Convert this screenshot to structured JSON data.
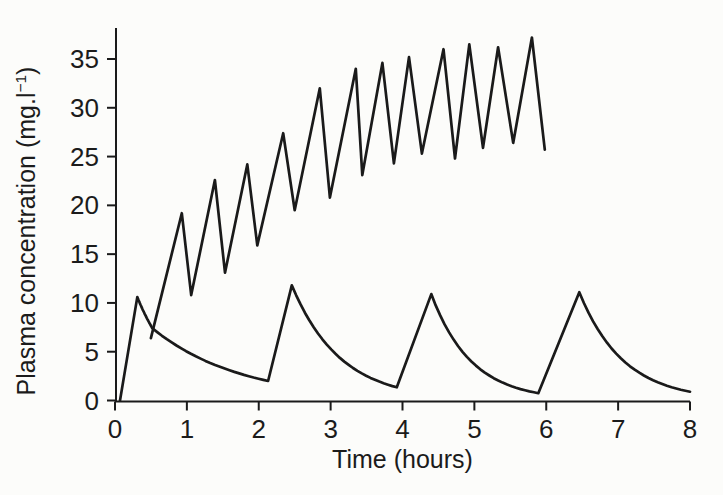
{
  "figure": {
    "background_color": "#fcfcfa",
    "ink_color": "#1a1a1a"
  },
  "chart_data": {
    "type": "line",
    "title": "",
    "xlabel": "Time (hours)",
    "ylabel": "Plasma concentration (mg.l⁻¹)",
    "ylabel_parts": {
      "pre": "Plasma concentration (mg.l",
      "sup": "−1",
      "post": ")"
    },
    "xlim": [
      0,
      8
    ],
    "ylim": [
      0,
      38
    ],
    "xticks": [
      0,
      1,
      2,
      3,
      4,
      5,
      6,
      7,
      8
    ],
    "yticks": [
      0,
      5,
      10,
      15,
      20,
      25,
      30,
      35
    ],
    "grid": false,
    "legend_position": "none",
    "series": [
      {
        "name": "frequent-repeated-doses-sawtooth",
        "interp": "linear",
        "points": [
          [
            0.5,
            6.4
          ],
          [
            0.93,
            19.2
          ],
          [
            1.06,
            10.8
          ],
          [
            1.39,
            22.6
          ],
          [
            1.53,
            13.1
          ],
          [
            1.84,
            24.2
          ],
          [
            1.98,
            15.9
          ],
          [
            2.34,
            27.4
          ],
          [
            2.5,
            19.5
          ],
          [
            2.85,
            32.0
          ],
          [
            2.99,
            20.8
          ],
          [
            3.35,
            34.0
          ],
          [
            3.44,
            23.1
          ],
          [
            3.72,
            34.6
          ],
          [
            3.88,
            24.3
          ],
          [
            4.09,
            35.2
          ],
          [
            4.27,
            25.3
          ],
          [
            4.57,
            36.0
          ],
          [
            4.73,
            24.8
          ],
          [
            4.93,
            36.5
          ],
          [
            5.12,
            25.9
          ],
          [
            5.33,
            36.2
          ],
          [
            5.54,
            26.4
          ],
          [
            5.8,
            37.2
          ],
          [
            5.98,
            25.7
          ]
        ]
      },
      {
        "name": "two-hourly-doses-curve",
        "interp": "mixed",
        "points": [
          [
            0.07,
            0.0
          ],
          [
            0.31,
            10.6
          ],
          [
            0.52,
            7.4
          ],
          [
            2.13,
            2.0
          ],
          [
            2.46,
            11.8
          ],
          [
            3.92,
            1.35
          ],
          [
            4.4,
            10.9
          ],
          [
            5.89,
            0.75
          ],
          [
            6.46,
            11.1
          ],
          [
            8.0,
            0.9
          ]
        ],
        "segment_shapes": [
          "L",
          "E",
          "E",
          "L",
          "E",
          "L",
          "E",
          "L",
          "E"
        ]
      }
    ]
  }
}
